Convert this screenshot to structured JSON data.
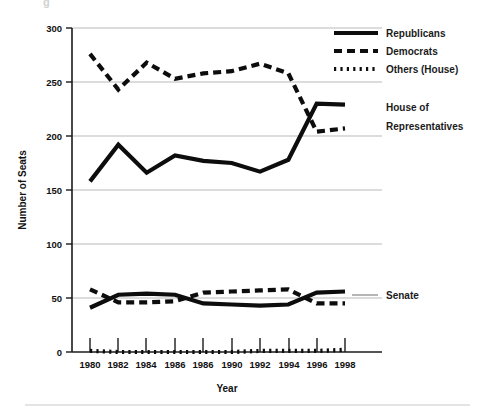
{
  "figure": {
    "footer_rule": true,
    "ghost_glyph": "g"
  },
  "axes": {
    "ylabel": "Number of Seats",
    "xlabel": "Year",
    "y_ticks": [
      "0",
      "50",
      "100",
      "150",
      "200",
      "250",
      "300"
    ],
    "x_ticks": [
      "1980",
      "1982",
      "1984",
      "1986",
      "1986",
      "1990",
      "1992",
      "1994",
      "1996",
      "1998"
    ]
  },
  "legend": {
    "position": "top-right",
    "items": [
      {
        "label": "Republicans",
        "style": "solid"
      },
      {
        "label": "Democrats",
        "style": "dashed"
      },
      {
        "label": "Others (House)",
        "style": "dotted"
      }
    ]
  },
  "annotations": {
    "house": {
      "line1": "House of",
      "line2": "Representatives"
    },
    "senate": {
      "line1": "Senate"
    }
  },
  "colors": {
    "ink": "#0d0d0d",
    "grid": "#b9b9b9",
    "background": "#ffffff",
    "leader": "#6d6d6d"
  },
  "chart_data": {
    "type": "line",
    "title": "",
    "xlabel": "Year",
    "ylabel": "Number of Seats",
    "xlim": [
      1980,
      1998
    ],
    "ylim": [
      0,
      300
    ],
    "grid": true,
    "legend_position": "top-right",
    "x": [
      1980,
      1982,
      1984,
      1986,
      1988,
      1990,
      1992,
      1994,
      1996,
      1998
    ],
    "x_tick_labels": [
      "1980",
      "1982",
      "1984",
      "1986",
      "1986",
      "1990",
      "1992",
      "1994",
      "1996",
      "1998"
    ],
    "y_ticks": [
      0,
      50,
      100,
      150,
      200,
      250,
      300
    ],
    "series": [
      {
        "name": "Republicans",
        "chamber": "House of Representatives",
        "style": "solid",
        "values": [
          158,
          192,
          166,
          182,
          177,
          175,
          167,
          178,
          230,
          229
        ]
      },
      {
        "name": "Democrats",
        "chamber": "House of Representatives",
        "style": "dashed",
        "values": [
          276,
          243,
          268,
          253,
          258,
          260,
          267,
          258,
          204,
          207
        ]
      },
      {
        "name": "Others (House)",
        "chamber": "House of Representatives",
        "style": "dotted",
        "values": [
          1,
          0,
          0,
          0,
          0,
          0,
          1,
          1,
          1,
          2
        ]
      },
      {
        "name": "Republicans",
        "chamber": "Senate",
        "style": "solid",
        "values": [
          41,
          53,
          54,
          53,
          45,
          44,
          43,
          44,
          55,
          56
        ]
      },
      {
        "name": "Democrats",
        "chamber": "Senate",
        "style": "dashed",
        "values": [
          58,
          46,
          46,
          47,
          55,
          56,
          57,
          58,
          45,
          45
        ]
      }
    ],
    "annotations": [
      {
        "text": "House of Representatives",
        "near_x": 1998,
        "near_y": 220
      },
      {
        "text": "Senate",
        "near_x": 1998,
        "near_y": 52
      }
    ]
  }
}
